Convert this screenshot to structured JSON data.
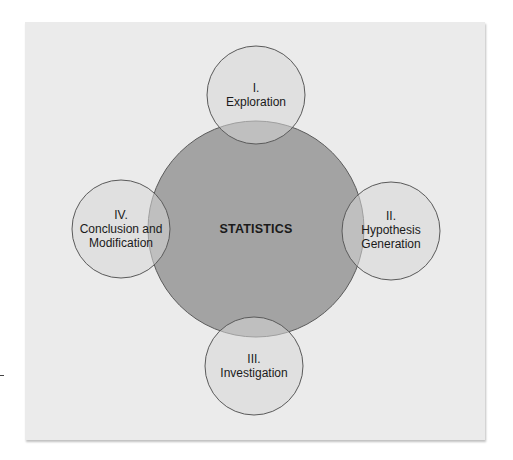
{
  "diagram": {
    "center": {
      "label": "STATISTICS"
    },
    "stages": [
      {
        "numeral": "I.",
        "title": "Exploration"
      },
      {
        "numeral": "II.",
        "title": "Hypothesis",
        "title2": "Generation"
      },
      {
        "numeral": "III.",
        "title": "Investigation"
      },
      {
        "numeral": "IV.",
        "title": "Conclusion and",
        "title2": "Modification"
      }
    ]
  },
  "colors": {
    "panel": "#ebebeb",
    "center_circle": "#a3a3a3",
    "stage_circle": "#d6d6d6",
    "outline": "#5a5a5a"
  }
}
